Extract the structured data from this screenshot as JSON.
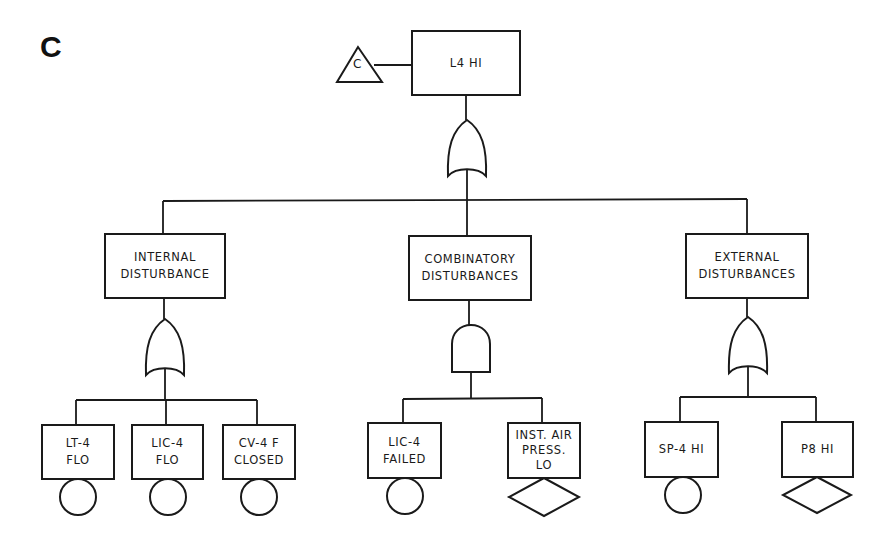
{
  "panel_label": "C",
  "top_event": {
    "label": "L4 HI",
    "transfer_symbol": "C"
  },
  "gates": {
    "top": "or-gate",
    "internal": "or-gate",
    "combinatory": "and-gate",
    "external": "or-gate"
  },
  "intermediate_events": [
    {
      "label": "INTERNAL\nDISTURBANCE"
    },
    {
      "label": "COMBINATORY\nDISTURBANCES"
    },
    {
      "label": "EXTERNAL\nDISTURBANCES"
    }
  ],
  "basic_events": [
    {
      "label": "LT-4\nFLO",
      "symbol": "circle"
    },
    {
      "label": "LIC-4\nFLO",
      "symbol": "circle"
    },
    {
      "label": "CV-4 F\nCLOSED",
      "symbol": "circle"
    },
    {
      "label": "LIC-4\nFAILED",
      "symbol": "circle"
    },
    {
      "label": "INST. AIR\nPRESS.\nLO",
      "symbol": "diamond"
    },
    {
      "label": "SP-4 HI",
      "symbol": "circle"
    },
    {
      "label": "P8 HI",
      "symbol": "diamond"
    }
  ]
}
